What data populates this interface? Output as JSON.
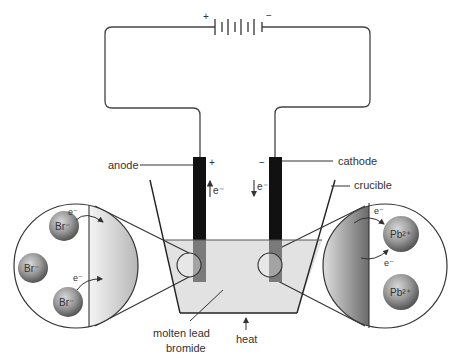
{
  "diagram": {
    "type": "electrolysis apparatus",
    "battery": {
      "positive_sign": "+",
      "negative_sign": "−"
    },
    "electrodes": {
      "anode": {
        "label": "anode",
        "sign": "+",
        "electron_label": "e⁻",
        "electron_direction": "up"
      },
      "cathode": {
        "label": "cathode",
        "sign": "−",
        "electron_label": "e⁻",
        "electron_direction": "down"
      }
    },
    "labels": {
      "crucible": "crucible",
      "molten_line1": "molten lead",
      "molten_line2": "bromide",
      "heat": "heat"
    },
    "left_inset": {
      "ions": [
        "Br⁻",
        "Br⁻",
        "Br⁻"
      ],
      "electrons": [
        "e⁻",
        "e⁻"
      ]
    },
    "right_inset": {
      "ions": [
        "Pb²⁺",
        "Pb²⁺"
      ],
      "electrons": [
        "e⁻",
        "e⁻"
      ]
    },
    "colors": {
      "line": "#333333",
      "electrode": "#111111",
      "liquid": "#e2e2e2",
      "ion_fill": "#8a8a8a"
    }
  }
}
